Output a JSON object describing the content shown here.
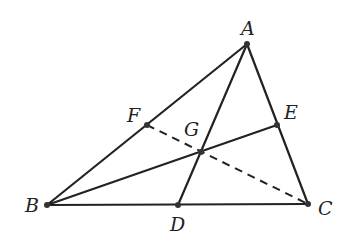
{
  "diagram": {
    "points": {
      "A": {
        "label": "A",
        "x": 247,
        "y": 44,
        "lx": 241,
        "ly": 35
      },
      "B": {
        "label": "B",
        "x": 47,
        "y": 205,
        "lx": 25,
        "ly": 212
      },
      "C": {
        "label": "C",
        "x": 308,
        "y": 204,
        "lx": 318,
        "ly": 215
      },
      "D": {
        "label": "D",
        "x": 178,
        "y": 205,
        "lx": 170,
        "ly": 231
      },
      "E": {
        "label": "E",
        "x": 277,
        "y": 125,
        "lx": 284,
        "ly": 119
      },
      "F": {
        "label": "F",
        "x": 147,
        "y": 125,
        "lx": 127,
        "ly": 122
      },
      "G": {
        "label": "G",
        "x": 201,
        "y": 152,
        "lx": 184,
        "ly": 136
      }
    },
    "segments_solid": [
      [
        "A",
        "B"
      ],
      [
        "A",
        "C"
      ],
      [
        "B",
        "C"
      ],
      [
        "A",
        "D"
      ],
      [
        "B",
        "E"
      ]
    ],
    "segments_dashed": [
      [
        "F",
        "C"
      ]
    ]
  }
}
